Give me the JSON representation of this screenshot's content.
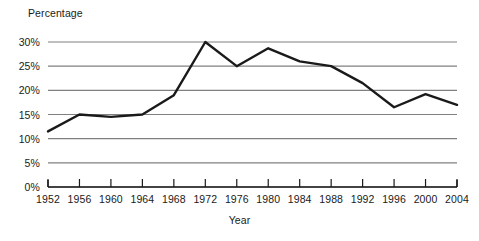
{
  "chart_data": {
    "type": "line",
    "title": "",
    "xlabel": "Year",
    "ylabel": "Percentage",
    "categories": [
      1952,
      1956,
      1960,
      1964,
      1968,
      1972,
      1976,
      1980,
      1984,
      1988,
      1992,
      1996,
      2000,
      2004
    ],
    "x_tick_labels": [
      "1952",
      "1956",
      "1960",
      "1964",
      "1968",
      "1972",
      "1976",
      "1980",
      "1984",
      "1988",
      "1992",
      "1996",
      "2000",
      "2004"
    ],
    "values": [
      11.5,
      15.0,
      14.5,
      15.0,
      19.0,
      30.0,
      25.0,
      28.7,
      26.0,
      25.0,
      21.5,
      16.5,
      19.2,
      17.0
    ],
    "y_tick_values": [
      0,
      5,
      10,
      15,
      20,
      25,
      30
    ],
    "y_tick_labels": [
      "0%",
      "5%",
      "10%",
      "15%",
      "20%",
      "25%",
      "30%"
    ],
    "ylim": [
      0,
      30
    ],
    "xlim": [
      1952,
      2004
    ],
    "grid": true,
    "grid_axis": "y",
    "legend": false,
    "legend_position": "none",
    "series": [
      {
        "name": "Percentage",
        "values": [
          11.5,
          15.0,
          14.5,
          15.0,
          19.0,
          30.0,
          25.0,
          28.7,
          26.0,
          25.0,
          21.5,
          16.5,
          19.2,
          17.0
        ]
      }
    ],
    "colors": {
      "line": "#1a1a1a",
      "grid": "#808080",
      "axis": "#1a1a1a",
      "background": "#ffffff",
      "text": "#1a1a1a"
    }
  }
}
